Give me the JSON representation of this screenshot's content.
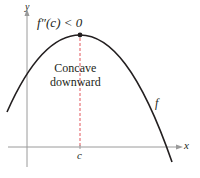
{
  "figure": {
    "condition_label": "f″(c) < 0",
    "region_label_line1": "Concave",
    "region_label_line2": "downward",
    "function_label": "f",
    "point_label": "c",
    "x_axis_label": "x",
    "y_axis_label": "y"
  },
  "colors": {
    "curve": "#231f20",
    "axes": "#9a9a9a",
    "dashed_line": "#e2555a",
    "point": "#231f20",
    "background": "#ffffff"
  }
}
